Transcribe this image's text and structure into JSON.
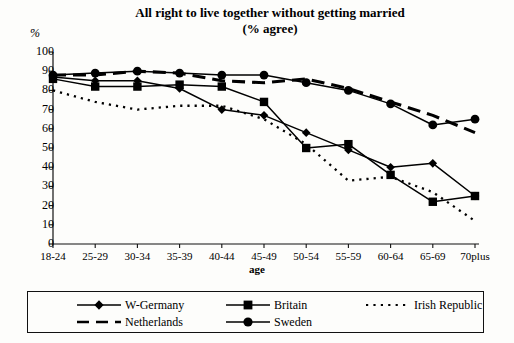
{
  "chart_data": {
    "type": "line",
    "title": "All right to live together without getting married",
    "subtitle": "(% agree)",
    "ylabel": "%",
    "xlabel": "age",
    "ylim": [
      0,
      100
    ],
    "ytick_step": 10,
    "grid": false,
    "legend_position": "bottom",
    "yticks": [
      "0",
      "10",
      "20",
      "30",
      "40",
      "50",
      "60",
      "70",
      "80",
      "90",
      "100"
    ],
    "categories": [
      "18-24",
      "25-29",
      "30-34",
      "35-39",
      "40-44",
      "45-49",
      "50-54",
      "55-59",
      "60-64",
      "65-69",
      "70plus"
    ],
    "series": [
      {
        "name": "W-Germany",
        "marker": "diamond",
        "linestyle": "solid",
        "color": "#000000",
        "values": [
          87,
          85,
          85,
          81,
          70,
          67,
          58,
          49,
          40,
          42,
          25
        ]
      },
      {
        "name": "Britain",
        "marker": "square",
        "linestyle": "solid",
        "color": "#000000",
        "values": [
          86,
          82,
          82,
          83,
          82,
          74,
          50,
          52,
          36,
          22,
          25
        ]
      },
      {
        "name": "Netherlands",
        "marker": "none",
        "linestyle": "dashed",
        "color": "#000000",
        "values": [
          88,
          88,
          90,
          89,
          85,
          84,
          86,
          81,
          74,
          67,
          58
        ]
      },
      {
        "name": "Sweden",
        "marker": "circle",
        "linestyle": "solid",
        "color": "#000000",
        "values": [
          88,
          89,
          90,
          89,
          88,
          88,
          84,
          80,
          73,
          62,
          65
        ]
      },
      {
        "name": "Irish Republic",
        "marker": "none",
        "linestyle": "dotted",
        "color": "#000000",
        "values": [
          80,
          74,
          70,
          72,
          72,
          65,
          52,
          33,
          35,
          27,
          12
        ]
      }
    ]
  },
  "legend": {
    "entries": [
      {
        "label": "W-Germany"
      },
      {
        "label": "Britain"
      },
      {
        "label": "Irish Republic"
      },
      {
        "label": "Netherlands"
      },
      {
        "label": "Sweden"
      }
    ]
  }
}
